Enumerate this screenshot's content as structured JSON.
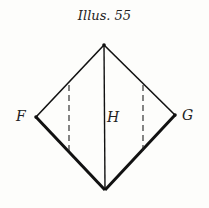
{
  "title": "Illus. 55",
  "labels": {
    "left": "F",
    "right": "G",
    "center": "H"
  },
  "diagram": {
    "type": "diamond with vertical center line and two dashed verticals",
    "vertices": {
      "top": [
        104,
        45
      ],
      "left": [
        36,
        117
      ],
      "right": [
        175,
        115
      ],
      "bottom": [
        105,
        190
      ]
    },
    "line_color": "#111111"
  }
}
